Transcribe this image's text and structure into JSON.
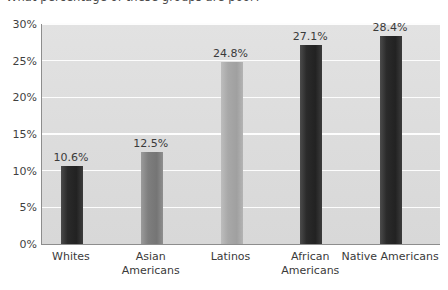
{
  "chart_data": {
    "type": "bar",
    "title": "What percentage of these groups are poor?",
    "xlabel": "",
    "ylabel": "",
    "ylim": [
      0,
      30
    ],
    "grid": true,
    "legend": "none",
    "categories": [
      "Whites",
      "Asian\nAmericans",
      "Latinos",
      "African\nAmericans",
      "Native Americans"
    ],
    "values": [
      10.6,
      12.5,
      24.8,
      27.1,
      28.4
    ],
    "data_labels": [
      "10.6%",
      "12.5%",
      "24.8%",
      "27.1%",
      "28.4%"
    ],
    "ytick_labels": [
      "30%",
      "25%",
      "20%",
      "15%",
      "10%",
      "5%",
      "0%"
    ],
    "ytick_values": [
      30,
      25,
      20,
      15,
      10,
      5,
      0
    ],
    "bar_styles": [
      "dark",
      "mid",
      "light",
      "dark",
      "dark"
    ],
    "colors": {
      "plot_background": "#dedede",
      "gridline": "#fdfdfd",
      "axis": "#8d8d8d",
      "bar_dark": "#2a2a2a",
      "bar_mid": "#7e7e7e",
      "bar_light": "#a8a8a8",
      "text": "#3a3a3a"
    }
  }
}
